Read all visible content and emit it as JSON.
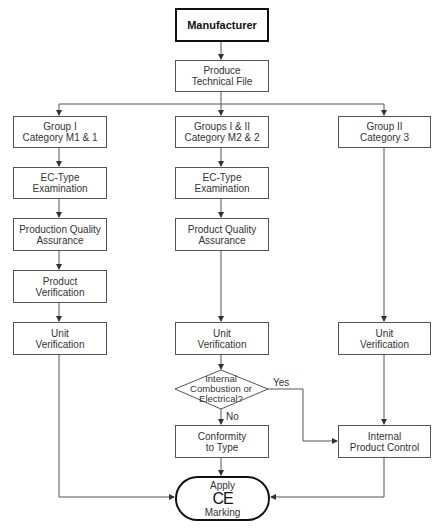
{
  "diagram": {
    "nodes": {
      "manufacturer": {
        "line1": "Manufacturer"
      },
      "technical_file": {
        "line1": "Produce",
        "line2": "Technical File"
      },
      "group1": {
        "line1": "Group I",
        "line2": "Category M1 & 1"
      },
      "group12": {
        "line1": "Groups I & II",
        "line2": "Category M2 & 2"
      },
      "group2": {
        "line1": "Group II",
        "line2": "Category 3"
      },
      "ec_type_left": {
        "line1": "EC-Type",
        "line2": "Examination"
      },
      "ec_type_mid": {
        "line1": "EC-Type",
        "line2": "Examination"
      },
      "production_qa": {
        "line1": "Production Quality",
        "line2": "Assurance"
      },
      "product_qa": {
        "line1": "Product Quality",
        "line2": "Assurance"
      },
      "product_verification": {
        "line1": "Product",
        "line2": "Verification"
      },
      "unit_verification_left": {
        "line1": "Unit",
        "line2": "Verification"
      },
      "unit_verification_mid": {
        "line1": "Unit",
        "line2": "Verification"
      },
      "unit_verification_right": {
        "line1": "Unit",
        "line2": "Verification"
      },
      "decision": {
        "line1": "Internal",
        "line2": "Combustion or",
        "line3": "Electrical?"
      },
      "conformity": {
        "line1": "Conformity",
        "line2": "to Type"
      },
      "internal_control": {
        "line1": "Internal",
        "line2": "Product Control"
      },
      "apply_ce": {
        "line1": "Apply",
        "symbol": "CE",
        "line2": "Marking"
      }
    },
    "edge_labels": {
      "yes": "Yes",
      "no": "No"
    },
    "colors": {
      "line": "#555555",
      "border_strong": "#111111",
      "background": "#ffffff"
    }
  }
}
